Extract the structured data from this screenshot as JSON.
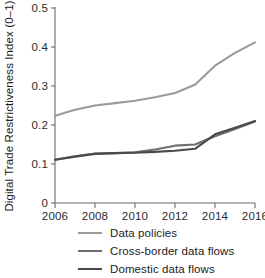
{
  "chart_data": {
    "type": "line",
    "title": "",
    "xlabel": "",
    "ylabel": "Digital Trade Restrictiveness Index (0–1)",
    "x": [
      2006,
      2007,
      2008,
      2009,
      2010,
      2011,
      2012,
      2013,
      2014,
      2015,
      2016
    ],
    "xlim": [
      2006,
      2016
    ],
    "ylim": [
      0,
      0.5
    ],
    "xticks": [
      "2006",
      "2008",
      "2010",
      "2012",
      "2014",
      "2016"
    ],
    "xtick_values": [
      2006,
      2008,
      2010,
      2012,
      2014,
      2016
    ],
    "yticks": [
      "0",
      "0.1",
      "0.2",
      "0.3",
      "0.4",
      "0.5"
    ],
    "ytick_values": [
      0,
      0.1,
      0.2,
      0.3,
      0.4,
      0.5
    ],
    "grid": false,
    "legend_position": "below",
    "series": [
      {
        "name": "Data policies",
        "color": "#9a9a9a",
        "values": [
          0.224,
          0.239,
          0.25,
          0.256,
          0.262,
          0.271,
          0.282,
          0.303,
          0.352,
          0.385,
          0.412
        ]
      },
      {
        "name": "Cross-border data flows",
        "color": "#6e6e6e",
        "values": [
          0.111,
          0.12,
          0.127,
          0.128,
          0.13,
          0.137,
          0.147,
          0.15,
          0.171,
          0.19,
          0.209
        ]
      },
      {
        "name": "Domestic data flows",
        "color": "#4a4a4a",
        "values": [
          0.111,
          0.119,
          0.126,
          0.128,
          0.129,
          0.131,
          0.134,
          0.139,
          0.176,
          0.193,
          0.21
        ]
      }
    ]
  },
  "legend": {
    "items": [
      {
        "label": "Data policies",
        "color": "#9a9a9a"
      },
      {
        "label": "Cross-border data flows",
        "color": "#6e6e6e"
      },
      {
        "label": "Domestic data flows",
        "color": "#4a4a4a"
      }
    ]
  }
}
